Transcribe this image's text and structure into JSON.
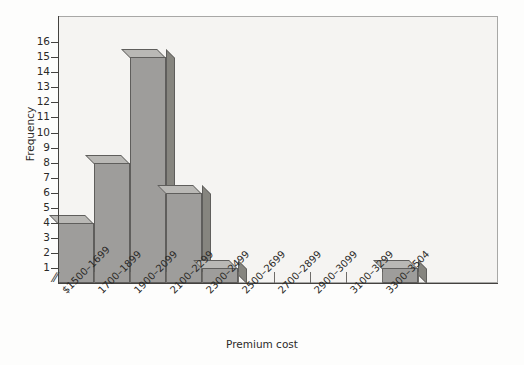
{
  "chart_data": {
    "type": "bar",
    "title": "",
    "xlabel": "Premium cost",
    "ylabel": "Frequency",
    "categories": [
      "$1500–1699",
      "1700–1899",
      "1900–2099",
      "2100–2299",
      "2300–2499",
      "2500–2699",
      "2700–2899",
      "2900–3099",
      "3100–3299",
      "3300–3504"
    ],
    "values": [
      4,
      8,
      15,
      6,
      1,
      0,
      0,
      0,
      0,
      1
    ],
    "ylim": [
      0,
      16
    ],
    "ytick_labels": [
      "16",
      "15",
      "14",
      "13",
      "12",
      "11",
      "10",
      "9",
      "8",
      "7",
      "6",
      "5",
      "4",
      "3",
      "2",
      "1"
    ],
    "ytick_values": [
      16,
      15,
      14,
      13,
      12,
      11,
      10,
      9,
      8,
      7,
      6,
      5,
      4,
      3,
      2,
      1
    ],
    "grid": false,
    "legend": null,
    "axis_break_symbol": "∕∕",
    "style": "3d-histogram",
    "colors": {
      "bar_front": "#9e9d9b",
      "bar_top": "#b9b8b5",
      "bar_side": "#86857f",
      "bar_outline": "#5f5e5c",
      "plot_background": "#f5f4f2",
      "axis": "#44423f",
      "text": "#2b2a28"
    }
  }
}
